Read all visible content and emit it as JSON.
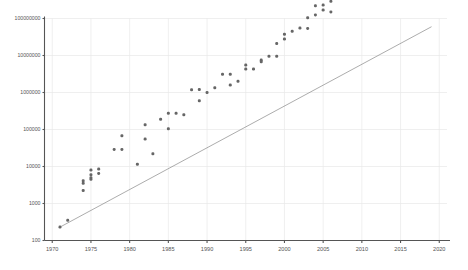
{
  "chart_data": {
    "type": "scatter",
    "title": "",
    "subtitle": "",
    "xlabel": "",
    "ylabel": "",
    "yscale": "log",
    "xlim": [
      1969,
      2021
    ],
    "ylim": [
      100,
      100000000
    ],
    "grid": true,
    "legend": null,
    "ytick_labels": [
      "100",
      "1000",
      "10000",
      "100000",
      "1000000",
      "10000000",
      "100000000"
    ],
    "ytick_values": [
      100,
      1000,
      10000,
      100000,
      1000000,
      10000000,
      100000000
    ],
    "xtick_labels": [
      "1970",
      "1975",
      "1980",
      "1985",
      "1990",
      "1995",
      "2000",
      "2005",
      "2010",
      "2015",
      "2020"
    ],
    "xtick_values": [
      1970,
      1975,
      1980,
      1985,
      1990,
      1995,
      2000,
      2005,
      2010,
      2015,
      2020
    ],
    "annotations": [],
    "series": [
      {
        "name": "trend-line",
        "type": "line",
        "color": "#888888",
        "points": [
          [
            1971,
            230
          ],
          [
            2019,
            60000000
          ]
        ]
      },
      {
        "name": "transistor-count",
        "type": "scatter",
        "color": "#666666",
        "x": [
          1971,
          1972,
          1974,
          1974,
          1974,
          1975,
          1975,
          1975,
          1975,
          1976,
          1976,
          1978,
          1979,
          1979,
          1981,
          1982,
          1982,
          1983,
          1984,
          1985,
          1985,
          1986,
          1987,
          1988,
          1989,
          1989,
          1990,
          1991,
          1992,
          1993,
          1993,
          1994,
          1995,
          1995,
          1996,
          1997,
          1997,
          1998,
          1999,
          1999,
          2000,
          2000,
          2001,
          2002,
          2003,
          2003,
          2004,
          2004,
          2005,
          2005,
          2006,
          2006,
          2007,
          2007,
          2008,
          2008,
          2008,
          2009,
          2009,
          2010,
          2010,
          2010,
          2011,
          2011,
          2011,
          2012,
          2012,
          2012,
          2013,
          2013,
          2013,
          2014,
          2014,
          2014,
          2014,
          2015,
          2015,
          2015,
          2015,
          2016,
          2016,
          2016,
          2016,
          2017,
          2017,
          2017,
          2017,
          2017,
          2018,
          2018,
          2018,
          2019,
          2019,
          2019
        ],
        "y": [
          230,
          350,
          2250,
          3500,
          4100,
          4500,
          5000,
          6000,
          8000,
          6500,
          8500,
          29000,
          29000,
          68000,
          11500,
          134000,
          55000,
          22000,
          190000,
          105000,
          275000,
          273000,
          250000,
          1180000,
          1200000,
          600000,
          1000000,
          1350000,
          3100000,
          3100000,
          1600000,
          2000000,
          5500000,
          4300000,
          4300000,
          7500000,
          6800000,
          9500000,
          21000000,
          9500000,
          28000000,
          37500000,
          45000000,
          55000000,
          105000000,
          54000000,
          125000000,
          220000000,
          230000000,
          169000000,
          291000000,
          151000000,
          582000000,
          411000000,
          731000000,
          1900000000,
          805000000,
          2300000000,
          904000000,
          1170000000,
          2600000000,
          1400000000,
          2270000000,
          1200000000,
          995000000,
          3100000000,
          1400000000,
          2400000000,
          4310000000,
          5000000000,
          1860000000,
          4200000000,
          3800000000,
          2600000000,
          1750000000,
          8000000000,
          5560000000,
          3200000000,
          4000000000,
          7200000000,
          3300000000,
          5700000000,
          1750000000,
          19200000000,
          8000000000,
          5000000000,
          21000000000,
          4800000000,
          19200000000,
          10000000000,
          6900000000,
          39500000000,
          21100000000,
          8000000000
        ]
      }
    ]
  },
  "axes": {
    "y_axis_name": "y-axis",
    "x_axis_name": "x-axis"
  }
}
